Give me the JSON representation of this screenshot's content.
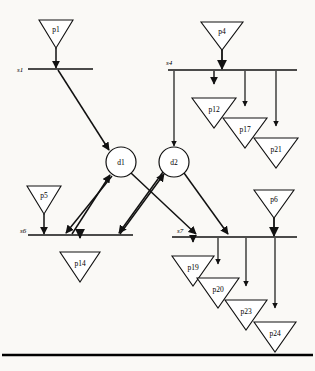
{
  "diagram": {
    "type": "petri-net",
    "colors": {
      "stroke": "#111111",
      "fill": "#ffffff",
      "background": "#faf9f6",
      "rule": "#000000"
    },
    "bottom_rule": {
      "label": "",
      "y": 355,
      "x1": 2,
      "x2": 313,
      "thickness": 2.5
    },
    "bars": [
      {
        "id": "s1",
        "label": "s1",
        "x1": 28,
        "x2": 93,
        "y": 69,
        "label_x": 20,
        "label_y": 72
      },
      {
        "id": "s4",
        "label": "s4",
        "x1": 168,
        "x2": 297,
        "y": 70,
        "label_x": 166,
        "label_y": 66
      },
      {
        "id": "s6",
        "label": "s6",
        "x1": 28,
        "x2": 133,
        "y": 235,
        "label_x": 22,
        "label_y": 233
      },
      {
        "id": "s7",
        "label": "s7",
        "x1": 172,
        "x2": 297,
        "y": 237,
        "label_x": 177,
        "label_y": 233
      }
    ],
    "places": [
      {
        "id": "p1",
        "label": "p1",
        "cx": 56,
        "cy": 20,
        "w": 34,
        "h": 28
      },
      {
        "id": "p4",
        "label": "p4",
        "cx": 222,
        "cy": 22,
        "w": 42,
        "h": 28
      },
      {
        "id": "p12",
        "label": "p12",
        "cx": 214,
        "cy": 98,
        "w": 44,
        "h": 30
      },
      {
        "id": "p17",
        "label": "p17",
        "cx": 245,
        "cy": 118,
        "w": 44,
        "h": 30
      },
      {
        "id": "p21",
        "label": "p21",
        "cx": 276,
        "cy": 138,
        "w": 44,
        "h": 30
      },
      {
        "id": "p5",
        "label": "p5",
        "cx": 44,
        "cy": 186,
        "w": 34,
        "h": 28
      },
      {
        "id": "p14",
        "label": "p14",
        "cx": 80,
        "cy": 252,
        "w": 40,
        "h": 30
      },
      {
        "id": "p6",
        "label": "p6",
        "cx": 274,
        "cy": 190,
        "w": 40,
        "h": 28
      },
      {
        "id": "p19",
        "label": "p19",
        "cx": 193,
        "cy": 256,
        "w": 42,
        "h": 30
      },
      {
        "id": "p20",
        "label": "p20",
        "cx": 218,
        "cy": 278,
        "w": 42,
        "h": 30
      },
      {
        "id": "p23",
        "label": "p23",
        "cx": 246,
        "cy": 300,
        "w": 42,
        "h": 30
      },
      {
        "id": "p24",
        "label": "p24",
        "cx": 275,
        "cy": 322,
        "w": 42,
        "h": 30
      }
    ],
    "decisions": [
      {
        "id": "d1",
        "label": "d1",
        "cx": 121,
        "cy": 162,
        "r": 15
      },
      {
        "id": "d2",
        "label": "d2",
        "cx": 174,
        "cy": 162,
        "r": 15
      }
    ],
    "edges": [
      {
        "from": "p1",
        "to": "s1",
        "kind": "place-to-bar"
      },
      {
        "from": "s1",
        "to": "d1",
        "kind": "bar-to-decision"
      },
      {
        "from": "p4",
        "to": "s4",
        "kind": "place-to-bar"
      },
      {
        "from": "s4",
        "to": "d2",
        "kind": "bar-to-decision"
      },
      {
        "from": "s4",
        "to": "p12",
        "kind": "bar-to-place"
      },
      {
        "from": "s4",
        "to": "p17",
        "kind": "bar-to-place"
      },
      {
        "from": "s4",
        "to": "p21",
        "kind": "bar-to-place"
      },
      {
        "from": "p5",
        "to": "s6",
        "kind": "place-to-bar"
      },
      {
        "from": "s6",
        "to": "d1",
        "kind": "bar-to-decision"
      },
      {
        "from": "d1",
        "to": "s6",
        "kind": "decision-to-bar"
      },
      {
        "from": "d1",
        "to": "s7",
        "kind": "decision-to-bar"
      },
      {
        "from": "d2",
        "to": "s6",
        "kind": "decision-to-bar"
      },
      {
        "from": "d2",
        "to": "s7",
        "kind": "decision-to-bar"
      },
      {
        "from": "s6",
        "to": "p14",
        "kind": "bar-to-place"
      },
      {
        "from": "p6",
        "to": "s7",
        "kind": "place-to-bar"
      },
      {
        "from": "s7",
        "to": "p19",
        "kind": "bar-to-place"
      },
      {
        "from": "s7",
        "to": "p20",
        "kind": "bar-to-place"
      },
      {
        "from": "s7",
        "to": "p23",
        "kind": "bar-to-place"
      },
      {
        "from": "s7",
        "to": "p24",
        "kind": "bar-to-place"
      }
    ]
  }
}
